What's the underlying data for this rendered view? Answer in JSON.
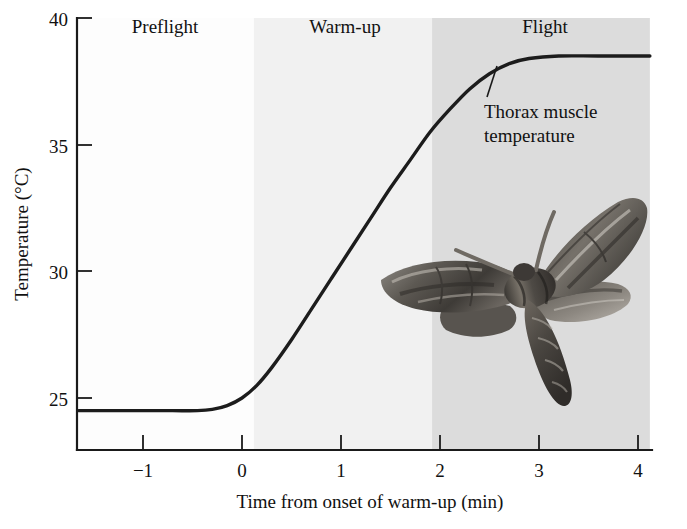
{
  "chart_data": {
    "type": "line",
    "title": "",
    "xlabel": "Time from onset of warm-up (min)",
    "ylabel": "Temperature (°C)",
    "xlim": [
      -1.65,
      4.12
    ],
    "ylim": [
      22.6,
      40
    ],
    "xticks": [
      -1,
      0,
      1,
      2,
      3,
      4
    ],
    "xtick_labels": [
      "−1",
      "0",
      "1",
      "2",
      "3",
      "4"
    ],
    "yticks": [
      25,
      30,
      35,
      40
    ],
    "ytick_labels": [
      "25",
      "30",
      "35",
      "40"
    ],
    "grid": false,
    "legend": "none",
    "series": [
      {
        "name": "Thorax muscle temperature",
        "x": [
          -1.65,
          -1.3,
          -1.0,
          -0.7,
          -0.45,
          -0.3,
          -0.15,
          0.0,
          0.15,
          0.3,
          0.5,
          0.7,
          0.9,
          1.1,
          1.3,
          1.5,
          1.7,
          1.9,
          2.1,
          2.3,
          2.5,
          2.7,
          2.9,
          3.2,
          3.6,
          4.12
        ],
        "y": [
          24.5,
          24.5,
          24.5,
          24.5,
          24.5,
          24.55,
          24.7,
          25.0,
          25.5,
          26.2,
          27.3,
          28.5,
          29.7,
          30.9,
          32.1,
          33.3,
          34.4,
          35.5,
          36.4,
          37.2,
          37.8,
          38.2,
          38.4,
          38.5,
          38.5,
          38.5
        ]
      }
    ],
    "annotations": [
      {
        "name": "curve-label",
        "text_line1": "Thorax muscle",
        "text_line2": "temperature",
        "points_to_x": 2.5,
        "points_to_y": 38.0
      }
    ],
    "phase_bands": [
      {
        "name": "preflight",
        "label": "Preflight",
        "x_start": -1.65,
        "x_end": 0.12,
        "color": "#fdfdfd"
      },
      {
        "name": "warm-up",
        "label": "Warm-up",
        "x_start": 0.12,
        "x_end": 1.92,
        "color": "#f1f1f1"
      },
      {
        "name": "flight",
        "label": "Flight",
        "x_start": 1.92,
        "x_end": 4.12,
        "color": "#dcdcdc"
      }
    ],
    "illustration": {
      "name": "hawk-moth-photo",
      "description": "Sphinx moth with spread wings"
    }
  },
  "colors": {
    "axis": "#1a1a1a",
    "curve": "#1c1c1c",
    "band_preflight": "#fdfdfd",
    "band_warmup": "#f1f1f1",
    "band_flight": "#dcdcdc",
    "text": "#111111"
  }
}
